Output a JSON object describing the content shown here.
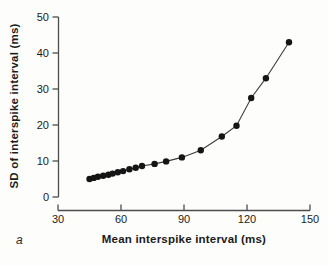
{
  "panel_label": "a",
  "chart_data": {
    "type": "line",
    "title": "",
    "xlabel": "Mean interspike interval (ms)",
    "ylabel": "SD of interspike interval (ms)",
    "xlim": [
      30,
      150
    ],
    "ylim": [
      0,
      50
    ],
    "x_ticks": [
      30,
      60,
      90,
      120,
      150
    ],
    "y_ticks": [
      0,
      10,
      20,
      30,
      40,
      50
    ],
    "grid": false,
    "legend": "none",
    "marker": "filled-circle",
    "marker_radius": 3.2,
    "colors": {
      "marker": "#151515",
      "line": "#3c3c3c",
      "axis": "#4d4d4d",
      "tick_text": "#1b1b1b",
      "background": "#fdfdfc"
    },
    "series": [
      {
        "name": "SD of interspike interval vs mean interspike interval",
        "points": [
          [
            45,
            5.0
          ],
          [
            47,
            5.3
          ],
          [
            49,
            5.6
          ],
          [
            51.5,
            5.9
          ],
          [
            54,
            6.2
          ],
          [
            56,
            6.5
          ],
          [
            58.5,
            6.9
          ],
          [
            61,
            7.2
          ],
          [
            64,
            7.7
          ],
          [
            67,
            8.1
          ],
          [
            70,
            8.6
          ],
          [
            76,
            9.2
          ],
          [
            81.5,
            9.9
          ],
          [
            89,
            11.0
          ],
          [
            98,
            13.0
          ],
          [
            108,
            16.8
          ],
          [
            115,
            19.8
          ],
          [
            122,
            27.5
          ],
          [
            129,
            33.0
          ],
          [
            140,
            43.0
          ]
        ]
      }
    ]
  }
}
